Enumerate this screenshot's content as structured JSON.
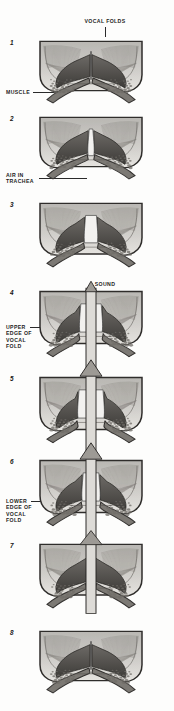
{
  "figure": {
    "style": "halftone grayscale engraving",
    "background_color": "#fdfdfc",
    "ink_color": "#1d1d1d"
  },
  "labels": {
    "vocal_folds": "VOCAL FOLDS",
    "muscle": "MUSCLE",
    "air_in_trachea": "AIR IN\nTRACHEA",
    "sound": "SOUND",
    "upper_edge": "UPPER\nEDGE OF\nVOCAL\nFOLD",
    "lower_edge": "LOWER\nEDGE OF\nVOCAL\nFOLD"
  },
  "panels": [
    {
      "number": "1",
      "top": 38,
      "height": 70,
      "state": "closed-adducted",
      "gap": 0.0,
      "arrow": "none",
      "arrow_top": 0,
      "arrow_height": 0
    },
    {
      "number": "2",
      "top": 114,
      "height": 70,
      "state": "closed-pressure-building",
      "gap": 0.06,
      "arrow": "none",
      "arrow_top": 0,
      "arrow_height": 0
    },
    {
      "number": "3",
      "top": 200,
      "height": 72,
      "state": "lower-edge-opening",
      "gap": 0.18,
      "arrow": "none",
      "arrow_top": 0,
      "arrow_height": 0
    },
    {
      "number": "4",
      "top": 288,
      "height": 74,
      "state": "open-glottis-air-escaping",
      "gap": 0.34,
      "arrow": "shaft",
      "arrow_top": -12,
      "arrow_height": 96
    },
    {
      "number": "5",
      "top": 374,
      "height": 74,
      "state": "maximum-open",
      "gap": 0.4,
      "arrow": "full",
      "arrow_top": -16,
      "arrow_height": 100
    },
    {
      "number": "6",
      "top": 457,
      "height": 74,
      "state": "lower-edge-closing",
      "gap": 0.26,
      "arrow": "full",
      "arrow_top": -16,
      "arrow_height": 100
    },
    {
      "number": "7",
      "top": 541,
      "height": 72,
      "state": "upper-edge-closing",
      "gap": 0.12,
      "arrow": "short",
      "arrow_top": -12,
      "arrow_height": 86
    },
    {
      "number": "8",
      "top": 628,
      "height": 70,
      "state": "closed-cycle-complete",
      "gap": 0.0,
      "arrow": "none",
      "arrow_top": 0,
      "arrow_height": 0
    }
  ]
}
